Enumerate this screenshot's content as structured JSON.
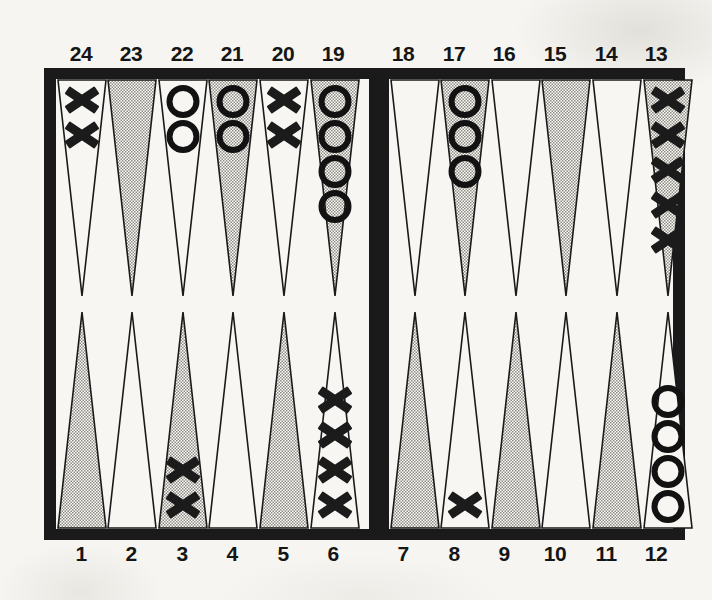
{
  "board": {
    "title": "Backgammon board position diagram",
    "colors": {
      "frame": "#1a1a1a",
      "field": "#f7f6f2",
      "page_background": "#f6f5f1",
      "shaded_point": "#b9b6ae",
      "plain_point": "#f7f6f2",
      "point_outline": "#1a1a1a",
      "checker": "#121212"
    },
    "checker_symbols": {
      "x": "X",
      "o": "O"
    },
    "top_labels": [
      "24",
      "23",
      "22",
      "21",
      "20",
      "19",
      "18",
      "17",
      "16",
      "15",
      "14",
      "13"
    ],
    "bottom_labels": [
      "1",
      "2",
      "3",
      "4",
      "5",
      "6",
      "7",
      "8",
      "9",
      "10",
      "11",
      "12"
    ],
    "points": [
      {
        "label": "24",
        "quadrant": "top-left",
        "shaded": false,
        "checker": "x",
        "count": 2
      },
      {
        "label": "23",
        "quadrant": "top-left",
        "shaded": true,
        "checker": "",
        "count": 0
      },
      {
        "label": "22",
        "quadrant": "top-left",
        "shaded": false,
        "checker": "o",
        "count": 2
      },
      {
        "label": "21",
        "quadrant": "top-left",
        "shaded": true,
        "checker": "o",
        "count": 2
      },
      {
        "label": "20",
        "quadrant": "top-left",
        "shaded": false,
        "checker": "x",
        "count": 2
      },
      {
        "label": "19",
        "quadrant": "top-left",
        "shaded": true,
        "checker": "o",
        "count": 4
      },
      {
        "label": "18",
        "quadrant": "top-right",
        "shaded": false,
        "checker": "",
        "count": 0
      },
      {
        "label": "17",
        "quadrant": "top-right",
        "shaded": true,
        "checker": "o",
        "count": 3
      },
      {
        "label": "16",
        "quadrant": "top-right",
        "shaded": false,
        "checker": "",
        "count": 0
      },
      {
        "label": "15",
        "quadrant": "top-right",
        "shaded": true,
        "checker": "",
        "count": 0
      },
      {
        "label": "14",
        "quadrant": "top-right",
        "shaded": false,
        "checker": "",
        "count": 0
      },
      {
        "label": "13",
        "quadrant": "top-right",
        "shaded": true,
        "checker": "x",
        "count": 5
      },
      {
        "label": "1",
        "quadrant": "bottom-left",
        "shaded": true,
        "checker": "",
        "count": 0
      },
      {
        "label": "2",
        "quadrant": "bottom-left",
        "shaded": false,
        "checker": "",
        "count": 0
      },
      {
        "label": "3",
        "quadrant": "bottom-left",
        "shaded": true,
        "checker": "x",
        "count": 2
      },
      {
        "label": "4",
        "quadrant": "bottom-left",
        "shaded": false,
        "checker": "",
        "count": 0
      },
      {
        "label": "5",
        "quadrant": "bottom-left",
        "shaded": true,
        "checker": "",
        "count": 0
      },
      {
        "label": "6",
        "quadrant": "bottom-left",
        "shaded": false,
        "checker": "x",
        "count": 4
      },
      {
        "label": "7",
        "quadrant": "bottom-right",
        "shaded": true,
        "checker": "",
        "count": 0
      },
      {
        "label": "8",
        "quadrant": "bottom-right",
        "shaded": false,
        "checker": "x",
        "count": 1
      },
      {
        "label": "9",
        "quadrant": "bottom-right",
        "shaded": true,
        "checker": "",
        "count": 0
      },
      {
        "label": "10",
        "quadrant": "bottom-right",
        "shaded": false,
        "checker": "",
        "count": 0
      },
      {
        "label": "11",
        "quadrant": "bottom-right",
        "shaded": true,
        "checker": "",
        "count": 0
      },
      {
        "label": "12",
        "quadrant": "bottom-right",
        "shaded": false,
        "checker": "o",
        "count": 4
      }
    ]
  }
}
